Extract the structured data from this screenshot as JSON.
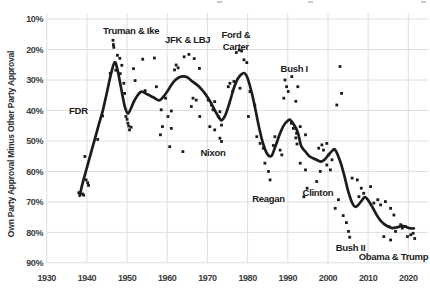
{
  "figure": {
    "background": "#ffffff",
    "ink_color": "#1c1c1c",
    "grid_color": "#dedede",
    "tick_color": "#3d3d3d",
    "cropped_text_artifacts_x": [
      217,
      308,
      421
    ]
  },
  "chart_data": {
    "type": "scatter",
    "title": "",
    "xlabel": "",
    "ylabel": "Own Party Approval Minus Other Party Approval",
    "grid": true,
    "legend": "none",
    "x_axis": {
      "min": 1930,
      "max": 2024,
      "ticks": [
        1930,
        1940,
        1950,
        1960,
        1970,
        1980,
        1990,
        2000,
        2010,
        2020
      ]
    },
    "y_axis": {
      "min": 10,
      "max": 90,
      "unit": "%",
      "inverted": true,
      "ticks": [
        10,
        20,
        30,
        40,
        50,
        60,
        70,
        80,
        90
      ]
    },
    "points": [
      [
        1938.0,
        67.0
      ],
      [
        1938.9,
        67.4
      ],
      [
        1939.2,
        67.8
      ],
      [
        1939.5,
        55.1
      ],
      [
        1939.8,
        62.8
      ],
      [
        1940.2,
        63.7
      ],
      [
        1940.4,
        64.6
      ],
      [
        1942.7,
        49.5
      ],
      [
        1943.9,
        41.8
      ],
      [
        1945.8,
        27.8
      ],
      [
        1946.5,
        17.0
      ],
      [
        1946.6,
        18.4
      ],
      [
        1946.7,
        19.3
      ],
      [
        1947.2,
        26.8
      ],
      [
        1947.6,
        21.9
      ],
      [
        1948.2,
        22.9
      ],
      [
        1948.3,
        27.9
      ],
      [
        1948.7,
        25.2
      ],
      [
        1949.2,
        31.1
      ],
      [
        1949.4,
        34.4
      ],
      [
        1949.7,
        42.0
      ],
      [
        1950.0,
        42.9
      ],
      [
        1950.2,
        44.2
      ],
      [
        1950.4,
        45.1
      ],
      [
        1950.6,
        46.4
      ],
      [
        1951.0,
        45.5
      ],
      [
        1951.6,
        26.3
      ],
      [
        1952.0,
        30.2
      ],
      [
        1953.9,
        23.2
      ],
      [
        1954.5,
        33.5
      ],
      [
        1956.8,
        22.8
      ],
      [
        1957.3,
        32.2
      ],
      [
        1958.3,
        48.0
      ],
      [
        1958.5,
        39.8
      ],
      [
        1958.8,
        45.3
      ],
      [
        1959.6,
        36.0
      ],
      [
        1960.2,
        42.0
      ],
      [
        1960.6,
        51.9
      ],
      [
        1961.0,
        40.2
      ],
      [
        1961.0,
        45.9
      ],
      [
        1961.8,
        26.7
      ],
      [
        1962.2,
        25.1
      ],
      [
        1962.7,
        26.0
      ],
      [
        1963.9,
        53.5
      ],
      [
        1964.2,
        22.4
      ],
      [
        1965.4,
        21.6
      ],
      [
        1966.0,
        38.7
      ],
      [
        1966.4,
        36.0
      ],
      [
        1966.7,
        23.0
      ],
      [
        1967.2,
        36.6
      ],
      [
        1968.0,
        26.2
      ],
      [
        1968.1,
        42.0
      ],
      [
        1970.2,
        36.6
      ],
      [
        1970.6,
        45.3
      ],
      [
        1971.0,
        38.2
      ],
      [
        1971.4,
        39.8
      ],
      [
        1971.8,
        37.1
      ],
      [
        1971.8,
        46.4
      ],
      [
        1972.7,
        42.0
      ],
      [
        1973.1,
        40.4
      ],
      [
        1973.1,
        49.1
      ],
      [
        1973.5,
        44.8
      ],
      [
        1973.5,
        50.2
      ],
      [
        1975.2,
        32.2
      ],
      [
        1975.6,
        31.1
      ],
      [
        1976.3,
        33.8
      ],
      [
        1976.6,
        30.5
      ],
      [
        1977.2,
        21.0
      ],
      [
        1977.9,
        20.2
      ],
      [
        1978.1,
        32.7
      ],
      [
        1978.5,
        20.5
      ],
      [
        1979.1,
        23.4
      ],
      [
        1979.8,
        24.3
      ],
      [
        1980.2,
        42.0
      ],
      [
        1980.6,
        33.8
      ],
      [
        1981.8,
        38.2
      ],
      [
        1982.3,
        48.6
      ],
      [
        1983.1,
        50.8
      ],
      [
        1983.9,
        52.4
      ],
      [
        1984.3,
        57.3
      ],
      [
        1985.2,
        60.0
      ],
      [
        1985.6,
        62.8
      ],
      [
        1986.4,
        51.5
      ],
      [
        1986.8,
        48.6
      ],
      [
        1988.1,
        53.0
      ],
      [
        1988.5,
        54.6
      ],
      [
        1989.0,
        36.0
      ],
      [
        1989.3,
        30.0
      ],
      [
        1989.7,
        32.2
      ],
      [
        1990.1,
        33.8
      ],
      [
        1990.9,
        44.2
      ],
      [
        1991.0,
        28.9
      ],
      [
        1991.4,
        45.9
      ],
      [
        1992.0,
        37.0
      ],
      [
        1992.0,
        49.0
      ],
      [
        1992.2,
        47.5
      ],
      [
        1992.3,
        51.0
      ],
      [
        1992.5,
        32.2
      ],
      [
        1993.1,
        45.3
      ],
      [
        1993.1,
        57.3
      ],
      [
        1994.0,
        68.3
      ],
      [
        1994.4,
        48.0
      ],
      [
        1994.4,
        59.5
      ],
      [
        1994.8,
        65.5
      ],
      [
        1997.2,
        63.3
      ],
      [
        1997.7,
        52.4
      ],
      [
        1998.1,
        60.0
      ],
      [
        1998.5,
        51.3
      ],
      [
        1998.9,
        53.0
      ],
      [
        1999.7,
        50.8
      ],
      [
        1999.7,
        57.9
      ],
      [
        2000.2,
        54.6
      ],
      [
        2000.6,
        59.5
      ],
      [
        2001.0,
        56.2
      ],
      [
        2001.8,
        72.1
      ],
      [
        2002.2,
        38.2
      ],
      [
        2002.6,
        69.3
      ],
      [
        2003.0,
        25.6
      ],
      [
        2003.4,
        34.4
      ],
      [
        2003.8,
        74.5
      ],
      [
        2004.6,
        76.8
      ],
      [
        2005.1,
        79.7
      ],
      [
        2005.4,
        81.6
      ],
      [
        2006.0,
        62.2
      ],
      [
        2007.3,
        62.8
      ],
      [
        2007.7,
        68.3
      ],
      [
        2008.3,
        65.5
      ],
      [
        2008.9,
        67.2
      ],
      [
        2010.6,
        65.0
      ],
      [
        2011.4,
        70.4
      ],
      [
        2012.4,
        69.3
      ],
      [
        2013.1,
        71.0
      ],
      [
        2013.9,
        81.4
      ],
      [
        2014.3,
        69.9
      ],
      [
        2015.2,
        78.1
      ],
      [
        2015.6,
        72.1
      ],
      [
        2015.6,
        82.5
      ],
      [
        2016.4,
        74.3
      ],
      [
        2016.8,
        79.7
      ],
      [
        2018.1,
        77.5
      ],
      [
        2018.5,
        78.6
      ],
      [
        2019.3,
        78.1
      ],
      [
        2019.8,
        81.4
      ],
      [
        2020.6,
        80.8
      ],
      [
        2021.2,
        80.3
      ],
      [
        2021.6,
        82.0
      ]
    ],
    "trend": [
      [
        1938.2,
        68.0
      ],
      [
        1939,
        63.5
      ],
      [
        1940,
        58.8
      ],
      [
        1941,
        54.0
      ],
      [
        1942,
        49.3
      ],
      [
        1943,
        44.5
      ],
      [
        1944,
        39.8
      ],
      [
        1945,
        34.0
      ],
      [
        1946,
        28.0
      ],
      [
        1946.9,
        24.2
      ],
      [
        1947.6,
        26.5
      ],
      [
        1948.5,
        32.5
      ],
      [
        1949.4,
        38.5
      ],
      [
        1950.2,
        41.0
      ],
      [
        1951,
        39.2
      ],
      [
        1952,
        36.3
      ],
      [
        1953.5,
        33.9
      ],
      [
        1955,
        34.7
      ],
      [
        1956.5,
        35.7
      ],
      [
        1958,
        36.7
      ],
      [
        1959,
        35.6
      ],
      [
        1960,
        33.8
      ],
      [
        1961,
        31.7
      ],
      [
        1962,
        30.0
      ],
      [
        1963,
        29.1
      ],
      [
        1964,
        28.8
      ],
      [
        1965,
        29.1
      ],
      [
        1966,
        30.2
      ],
      [
        1967,
        31.2
      ],
      [
        1968,
        32.3
      ],
      [
        1969,
        33.8
      ],
      [
        1970,
        35.6
      ],
      [
        1971,
        37.8
      ],
      [
        1972,
        40.4
      ],
      [
        1973,
        42.6
      ],
      [
        1973.6,
        43.2
      ],
      [
        1974.5,
        41.4
      ],
      [
        1975.5,
        37.5
      ],
      [
        1976.5,
        33.0
      ],
      [
        1977.5,
        29.7
      ],
      [
        1978.5,
        28.1
      ],
      [
        1979.3,
        27.8
      ],
      [
        1980,
        29.4
      ],
      [
        1981,
        34.0
      ],
      [
        1982,
        40.0
      ],
      [
        1983,
        46.5
      ],
      [
        1984,
        51.5
      ],
      [
        1985,
        54.5
      ],
      [
        1986,
        54.8
      ],
      [
        1987,
        51.5
      ],
      [
        1988,
        47.8
      ],
      [
        1989,
        44.9
      ],
      [
        1990,
        43.4
      ],
      [
        1990.6,
        43.1
      ],
      [
        1991.5,
        44.6
      ],
      [
        1992.5,
        47.2
      ],
      [
        1993.3,
        51.5
      ],
      [
        1994.3,
        53.4
      ],
      [
        1995.3,
        54.9
      ],
      [
        1996.3,
        55.7
      ],
      [
        1997.3,
        56.3
      ],
      [
        1998.3,
        56.8
      ],
      [
        1999.2,
        56.1
      ],
      [
        2000.1,
        54.6
      ],
      [
        2001,
        53.3
      ],
      [
        2001.8,
        52.9
      ],
      [
        2003,
        56.5
      ],
      [
        2004,
        61.0
      ],
      [
        2005,
        66.3
      ],
      [
        2006,
        70.3
      ],
      [
        2006.8,
        71.6
      ],
      [
        2007.6,
        70.9
      ],
      [
        2008.5,
        69.4
      ],
      [
        2009.2,
        68.4
      ],
      [
        2010,
        69.4
      ],
      [
        2011,
        71.6
      ],
      [
        2012,
        74.0
      ],
      [
        2013,
        76.0
      ],
      [
        2014,
        77.3
      ],
      [
        2015,
        78.1
      ],
      [
        2016,
        78.6
      ],
      [
        2017,
        78.4
      ],
      [
        2018,
        78.0
      ],
      [
        2018.8,
        77.9
      ],
      [
        2019.6,
        78.3
      ],
      [
        2020.6,
        78.7
      ],
      [
        2021.4,
        78.7
      ]
    ],
    "annotations": [
      {
        "label": "FDR",
        "year": 1937.9,
        "value": 40.1
      },
      {
        "label": "Truman & Ike",
        "year": 1951.0,
        "value": 13.8
      },
      {
        "label": "JFK & LBJ",
        "year": 1965.1,
        "value": 16.9
      },
      {
        "label": "Ford & Carter",
        "lines": [
          "Ford &",
          "Carter"
        ],
        "year": 1977.1,
        "value": 15.2
      },
      {
        "label": "Nixon",
        "year": 1971.4,
        "value": 54.0
      },
      {
        "label": "Bush I",
        "year": 1991.6,
        "value": 26.3
      },
      {
        "label": "Reagan",
        "year": 1985.2,
        "value": 68.9
      },
      {
        "label": "Clinton",
        "year": 1997.5,
        "value": 67.1
      },
      {
        "label": "Bush II",
        "year": 2005.6,
        "value": 85.0
      },
      {
        "label": "Obama & Trump",
        "year": 2016.3,
        "value": 88.1
      }
    ]
  }
}
